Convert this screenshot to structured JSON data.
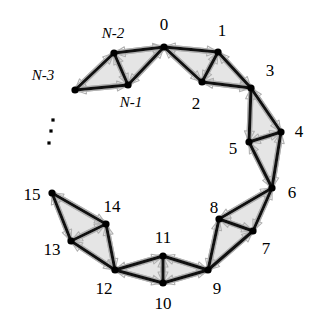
{
  "figure": {
    "type": "node-link-diagram",
    "background_color": "#ffffff",
    "line_color": "#111111",
    "face_fill_color": "#e0e0e0",
    "arrow_outline_color": "#b0b0b0",
    "node_color": "#000000"
  },
  "nodes": [
    {
      "id": "n0",
      "label": "0",
      "x": 164,
      "y": 47,
      "label_x": 164,
      "label_y": 24,
      "style": "num"
    },
    {
      "id": "n1",
      "label": "1",
      "x": 218,
      "y": 52,
      "label_x": 222,
      "label_y": 30,
      "style": "num"
    },
    {
      "id": "n2",
      "label": "2",
      "x": 202,
      "y": 82,
      "label_x": 196,
      "label_y": 103,
      "style": "num"
    },
    {
      "id": "n3",
      "label": "3",
      "x": 251,
      "y": 88,
      "label_x": 270,
      "label_y": 70,
      "style": "num"
    },
    {
      "id": "n4",
      "label": "4",
      "x": 281,
      "y": 132,
      "label_x": 299,
      "label_y": 131,
      "style": "num"
    },
    {
      "id": "n5",
      "label": "5",
      "x": 249,
      "y": 142,
      "label_x": 233,
      "label_y": 148,
      "style": "num"
    },
    {
      "id": "n6",
      "label": "6",
      "x": 272,
      "y": 188,
      "label_x": 292,
      "label_y": 192,
      "style": "num"
    },
    {
      "id": "n7",
      "label": "7",
      "x": 253,
      "y": 231,
      "label_x": 266,
      "label_y": 248,
      "style": "num"
    },
    {
      "id": "n8",
      "label": "8",
      "x": 219,
      "y": 219,
      "label_x": 214,
      "label_y": 207,
      "style": "num"
    },
    {
      "id": "n9",
      "label": "9",
      "x": 208,
      "y": 270,
      "label_x": 217,
      "label_y": 288,
      "style": "num"
    },
    {
      "id": "n10",
      "label": "10",
      "x": 163,
      "y": 283,
      "label_x": 163,
      "label_y": 303,
      "style": "num"
    },
    {
      "id": "n11",
      "label": "11",
      "x": 163,
      "y": 256,
      "label_x": 163,
      "label_y": 237,
      "style": "num"
    },
    {
      "id": "n12",
      "label": "12",
      "x": 115,
      "y": 270,
      "label_x": 104,
      "label_y": 288,
      "style": "num"
    },
    {
      "id": "n13",
      "label": "13",
      "x": 71,
      "y": 241,
      "label_x": 52,
      "label_y": 249,
      "style": "num"
    },
    {
      "id": "n14",
      "label": "14",
      "x": 106,
      "y": 224,
      "label_x": 112,
      "label_y": 206,
      "style": "num"
    },
    {
      "id": "n15",
      "label": "15",
      "x": 52,
      "y": 193,
      "label_x": 32,
      "label_y": 194,
      "style": "num"
    },
    {
      "id": "nm3",
      "label": "N-3",
      "x": 75,
      "y": 90,
      "label_x": 43,
      "label_y": 75,
      "style": "sym"
    },
    {
      "id": "nm1",
      "label": "N-1",
      "x": 128,
      "y": 85,
      "label_x": 131,
      "label_y": 102,
      "style": "sym"
    },
    {
      "id": "nm2",
      "label": "N-2",
      "x": 114,
      "y": 53,
      "label_x": 113,
      "label_y": 33,
      "style": "sym"
    }
  ],
  "edges": [
    {
      "from": "n0",
      "to": "n1"
    },
    {
      "from": "n0",
      "to": "n2"
    },
    {
      "from": "n1",
      "to": "n2"
    },
    {
      "from": "n1",
      "to": "n3"
    },
    {
      "from": "n2",
      "to": "n3"
    },
    {
      "from": "n3",
      "to": "n4"
    },
    {
      "from": "n3",
      "to": "n5"
    },
    {
      "from": "n4",
      "to": "n5"
    },
    {
      "from": "n4",
      "to": "n6"
    },
    {
      "from": "n5",
      "to": "n6"
    },
    {
      "from": "n6",
      "to": "n7"
    },
    {
      "from": "n6",
      "to": "n8"
    },
    {
      "from": "n7",
      "to": "n8"
    },
    {
      "from": "n7",
      "to": "n9"
    },
    {
      "from": "n8",
      "to": "n9"
    },
    {
      "from": "n9",
      "to": "n10"
    },
    {
      "from": "n9",
      "to": "n11"
    },
    {
      "from": "n10",
      "to": "n11"
    },
    {
      "from": "n10",
      "to": "n12"
    },
    {
      "from": "n11",
      "to": "n12"
    },
    {
      "from": "n12",
      "to": "n13"
    },
    {
      "from": "n12",
      "to": "n14"
    },
    {
      "from": "n13",
      "to": "n14"
    },
    {
      "from": "n13",
      "to": "n15"
    },
    {
      "from": "n14",
      "to": "n15"
    },
    {
      "from": "nm3",
      "to": "nm1"
    },
    {
      "from": "nm3",
      "to": "nm2"
    },
    {
      "from": "nm1",
      "to": "nm2"
    },
    {
      "from": "nm1",
      "to": "n0"
    },
    {
      "from": "nm2",
      "to": "n0"
    }
  ],
  "faces": [
    {
      "nodes": [
        "n0",
        "n1",
        "n2"
      ]
    },
    {
      "nodes": [
        "n1",
        "n2",
        "n3"
      ]
    },
    {
      "nodes": [
        "n3",
        "n4",
        "n5"
      ]
    },
    {
      "nodes": [
        "n4",
        "n5",
        "n6"
      ]
    },
    {
      "nodes": [
        "n6",
        "n7",
        "n8"
      ]
    },
    {
      "nodes": [
        "n7",
        "n8",
        "n9"
      ]
    },
    {
      "nodes": [
        "n9",
        "n10",
        "n11"
      ]
    },
    {
      "nodes": [
        "n10",
        "n11",
        "n12"
      ]
    },
    {
      "nodes": [
        "n12",
        "n13",
        "n14"
      ]
    },
    {
      "nodes": [
        "n13",
        "n14",
        "n15"
      ]
    },
    {
      "nodes": [
        "nm3",
        "nm1",
        "nm2"
      ]
    },
    {
      "nodes": [
        "nm1",
        "nm2",
        "n0"
      ]
    }
  ],
  "ellipsis": {
    "name": "vertical-ellipsis",
    "dots": [
      {
        "x": 53,
        "y": 120
      },
      {
        "x": 51,
        "y": 131
      },
      {
        "x": 49,
        "y": 143
      }
    ],
    "size": 3.2
  }
}
